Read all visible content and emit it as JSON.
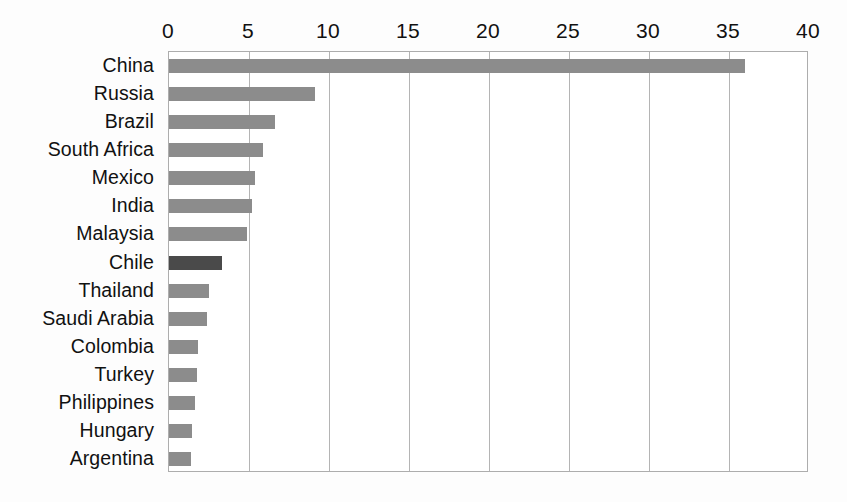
{
  "chart_data": {
    "type": "bar",
    "orientation": "horizontal",
    "title": "",
    "subtitle": "",
    "xlabel": "",
    "ylabel": "",
    "xlim": [
      0,
      40
    ],
    "ylim": null,
    "grid": true,
    "legend": null,
    "legend_position": "none",
    "xticks": [
      0,
      5,
      10,
      15,
      20,
      25,
      30,
      35,
      40
    ],
    "xtick_labels": [
      "0",
      "5",
      "10",
      "15",
      "20",
      "25",
      "30",
      "35",
      "40"
    ],
    "categories": [
      "China",
      "Russia",
      "Brazil",
      "South Africa",
      "Mexico",
      "India",
      "Malaysia",
      "Chile",
      "Thailand",
      "Saudi Arabia",
      "Colombia",
      "Turkey",
      "Philippines",
      "Hungary",
      "Argentina"
    ],
    "values": [
      36.0,
      9.1,
      6.6,
      5.9,
      5.4,
      5.2,
      4.9,
      3.3,
      2.5,
      2.4,
      1.8,
      1.75,
      1.6,
      1.45,
      1.35
    ],
    "highlight_category": "Chile",
    "colors": {
      "bar": "#8c8c8c",
      "bar_highlight": "#4a4a4a",
      "grid": "#b4b4b4",
      "axis": "#adadad",
      "text": "#111111",
      "background": "#ffffff"
    }
  }
}
